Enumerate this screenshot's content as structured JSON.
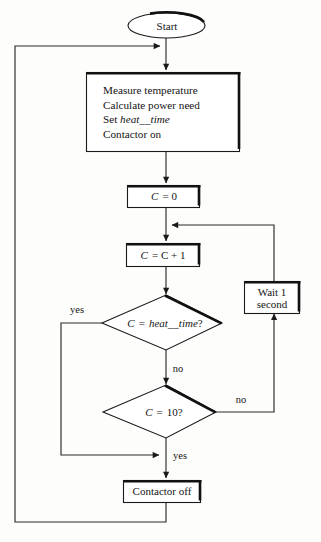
{
  "diagram": {
    "style": {
      "line_color": "#2a2a2a",
      "shadow_color": "#111111",
      "fill_color": "#ffffff",
      "background": "#fdfdfc",
      "text_color": "#141414"
    },
    "nodes": {
      "start": {
        "shape": "ellipse",
        "label": "Start"
      },
      "measure": {
        "shape": "process",
        "lines": [
          "Measure temperature",
          "Calculate power need",
          "Set heat__time",
          "Contactor on"
        ],
        "line1": "Measure temperature",
        "line2": "Calculate power need",
        "line3_prefix": "Set ",
        "line3_italic": "heat__time",
        "line4": "Contactor on"
      },
      "init_counter": {
        "shape": "process",
        "label": "C = 0",
        "var": "C",
        "expr": "= 0"
      },
      "increment": {
        "shape": "process",
        "label": "C = C + 1",
        "var": "C",
        "expr": "= C + 1"
      },
      "wait": {
        "shape": "process",
        "line1": "Wait 1",
        "line2": "second"
      },
      "decide_heat_time": {
        "shape": "decision",
        "var": "C",
        "op": "=",
        "operand_italic": "heat__time",
        "suffix": "?",
        "label": "C = heat__time?"
      },
      "decide_ten": {
        "shape": "decision",
        "var": "C",
        "op": "=",
        "operand": "10?",
        "label": "C = 10?"
      },
      "contactor_off": {
        "shape": "process",
        "label": "Contactor off"
      }
    },
    "edge_labels": {
      "heat_time_yes": "yes",
      "heat_time_no": "no",
      "ten_no": "no",
      "ten_yes": "yes"
    }
  }
}
